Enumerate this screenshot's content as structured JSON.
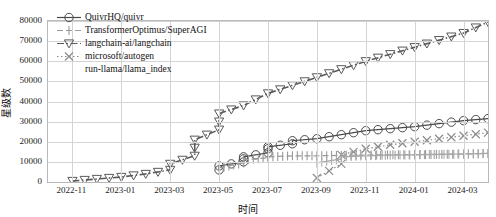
{
  "chart_data": {
    "type": "line",
    "title": "",
    "xlabel": "时间",
    "ylabel": "星级数",
    "grid": true,
    "legend_position": "upper-left",
    "ylim": [
      0,
      80000
    ],
    "yticks": [
      0,
      10000,
      20000,
      30000,
      40000,
      50000,
      60000,
      70000,
      80000
    ],
    "ytick_labels": [
      "0",
      "10000",
      "20000",
      "30000",
      "40000",
      "50000",
      "60000",
      "70000",
      "80000"
    ],
    "xticks": [
      "2022-11",
      "2023-01",
      "2023-03",
      "2023-05",
      "2023-07",
      "2023-09",
      "2023-11",
      "2024-01",
      "2024-03"
    ],
    "xlim": [
      "2022-10",
      "2024-04"
    ],
    "series": [
      {
        "name": "QuivrHQ/quivr",
        "marker": "circle",
        "linestyle": "solid",
        "color": "#4a4a4a",
        "x": [
          "2023-05",
          "2023-05",
          "2023-06",
          "2023-06",
          "2023-06",
          "2023-07",
          "2023-07",
          "2023-07",
          "2023-08",
          "2023-08",
          "2023-09",
          "2023-10",
          "2023-11",
          "2024-01",
          "2024-02",
          "2024-03",
          "2024-04"
        ],
        "y": [
          6000,
          8000,
          10000,
          11500,
          12500,
          14500,
          16500,
          17500,
          19000,
          20500,
          21500,
          23500,
          25500,
          27500,
          29000,
          30500,
          31500
        ]
      },
      {
        "name": "TransformerOptimus/SuperAGI",
        "marker": "tick",
        "linestyle": "dashed",
        "color": "#9a9a9a",
        "x": [
          "2023-05",
          "2023-06",
          "2023-06",
          "2023-07",
          "2023-07",
          "2023-08",
          "2023-09",
          "2023-10",
          "2023-11",
          "2024-01",
          "2024-03",
          "2024-04"
        ],
        "y": [
          7000,
          9500,
          11000,
          12000,
          12500,
          13000,
          13000,
          13200,
          13400,
          13600,
          13900,
          14200
        ]
      },
      {
        "name": "langchain-ai/langchain",
        "marker": "triangle-down",
        "linestyle": "dashdot",
        "color": "#5a5a5a",
        "x": [
          "2022-11",
          "2023-01",
          "2023-02",
          "2023-03",
          "2023-03",
          "2023-04",
          "2023-04",
          "2023-04",
          "2023-05",
          "2023-05",
          "2023-05",
          "2023-06",
          "2023-07",
          "2023-09",
          "2023-11",
          "2024-01",
          "2024-03",
          "2024-04"
        ],
        "y": [
          500,
          2500,
          4000,
          6000,
          9000,
          13000,
          17000,
          21000,
          26000,
          30000,
          34000,
          38000,
          44000,
          52000,
          60000,
          67000,
          74000,
          79500
        ]
      },
      {
        "name": "microsoft/autogen",
        "marker": "x",
        "linestyle": "dotted",
        "color": "#8c8c8c",
        "x": [
          "2023-09",
          "2023-10",
          "2023-10",
          "2023-11",
          "2023-12",
          "2024-01",
          "2024-02",
          "2024-03",
          "2024-04"
        ],
        "y": [
          2000,
          9000,
          13500,
          16500,
          18500,
          20000,
          21500,
          23000,
          24500
        ]
      },
      {
        "name": "run-llama/llama_index",
        "marker": "tick2",
        "linestyle": "solid",
        "color": "#a8a8a8",
        "x": [
          "2023-09",
          "2023-10",
          "2023-10",
          "2023-11",
          "2023-12",
          "2024-01",
          "2024-02",
          "2024-03",
          "2024-04"
        ],
        "y": [
          9500,
          11500,
          12500,
          13000,
          13300,
          13500,
          13700,
          13900,
          14200
        ]
      }
    ]
  },
  "legend": {
    "items": [
      {
        "label": "QuivrHQ/quivr"
      },
      {
        "label": "TransformerOptimus/SuperAGI"
      },
      {
        "label": "langchain-ai/langchain"
      },
      {
        "label": "microsoft/autogen"
      },
      {
        "label": "run-llama/llama_index"
      }
    ]
  }
}
